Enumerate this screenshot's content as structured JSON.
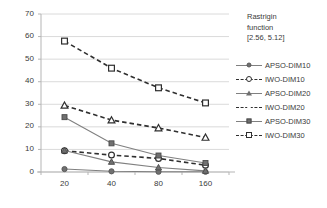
{
  "chart_data": {
    "type": "line",
    "title": "Rastrigin function [2.56, 5.12]",
    "title_lines": [
      "Rastrigin",
      "function",
      "[2.56, 5.12]"
    ],
    "xlabel": "",
    "ylabel": "",
    "categories": [
      "20",
      "40",
      "80",
      "160"
    ],
    "x": [
      20,
      40,
      80,
      160
    ],
    "ylim": [
      0,
      70
    ],
    "yticks": [
      "0",
      "10",
      "20",
      "30",
      "40",
      "50",
      "60",
      "70"
    ],
    "ytick_values": [
      0,
      10,
      20,
      30,
      40,
      50,
      60,
      70
    ],
    "grid": "horizontal",
    "legend_position": "right",
    "series": [
      {
        "name": "APSO-DIM10",
        "values": [
          1.3,
          0.3,
          0.1,
          0.1
        ],
        "line_style": "solid",
        "marker": "circle-filled",
        "color": "#808080"
      },
      {
        "name": "IWO-DIM10",
        "values": [
          9.4,
          7.5,
          6.0,
          3.0
        ],
        "line_style": "dashed",
        "marker": "circle-open",
        "color": "#2f2f2f"
      },
      {
        "name": "APSO-DIM20",
        "values": [
          9.5,
          4.5,
          2.0,
          0.5
        ],
        "line_style": "solid",
        "marker": "triangle-filled",
        "color": "#808080"
      },
      {
        "name": "IWO-DIM20",
        "values": [
          29.5,
          23.0,
          19.5,
          15.3
        ],
        "line_style": "dashed",
        "marker": "triangle-open",
        "color": "#2f2f2f"
      },
      {
        "name": "APSO-DIM30",
        "values": [
          24.3,
          12.7,
          7.3,
          4.0
        ],
        "line_style": "solid",
        "marker": "square-filled",
        "color": "#808080"
      },
      {
        "name": "IWO-DIM30",
        "values": [
          58.0,
          46.0,
          37.3,
          30.6
        ],
        "line_style": "dashed",
        "marker": "square-open",
        "color": "#2f2f2f"
      }
    ]
  },
  "legend": {
    "items": [
      {
        "label": "APSO-DIM10"
      },
      {
        "label": "IWO-DIM10"
      },
      {
        "label": "APSO-DIM20"
      },
      {
        "label": "IWO-DIM20"
      },
      {
        "label": "APSO-DIM30"
      },
      {
        "label": "IWO-DIM30"
      }
    ]
  },
  "colors": {
    "grid": "#d0d0d0",
    "axis": "#b5b5b5",
    "solid_series": "#808080",
    "dashed_series": "#2f2f2f",
    "text": "#3a3a3a",
    "background": "#ffffff"
  }
}
